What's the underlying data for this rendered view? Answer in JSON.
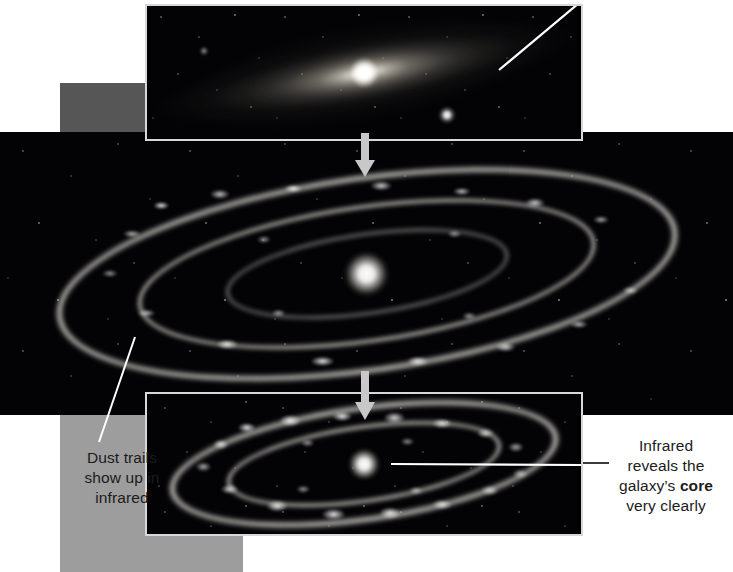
{
  "figure": {
    "background_color": "#ffffff"
  },
  "panels": [
    {
      "id": "visible-light",
      "name": "visible-light-panel",
      "description": "Visible light image of spiral galaxy with bright smooth core",
      "frame_color": "#d8d8d8",
      "sky_color": "#000000"
    },
    {
      "id": "infrared-wide",
      "name": "infrared-wide-panel",
      "description": "Wide infrared image of the galaxy showing dust rings",
      "frame_color": "#050507",
      "sky_color": "#050507"
    },
    {
      "id": "infrared-detail",
      "name": "infrared-detail-panel",
      "description": "Close infrared image revealing the galaxy core and dust rings",
      "frame_color": "#d8d8d8",
      "sky_color": "#000000"
    }
  ],
  "annotations": {
    "dust_trails": {
      "lines": [
        "Dust trails",
        "show up in",
        "infrared"
      ],
      "text": "Dust trails show up in infrared",
      "color": "#1b1b1b"
    },
    "infrared_core": {
      "line1": "Infrared",
      "line2": "reveals the",
      "line3_prefix": "galaxy’s ",
      "line3_bold": "core",
      "line4": "very clearly",
      "text": "Infrared reveals the galaxy’s core very clearly",
      "color": "#1b1b1b"
    }
  },
  "arrows": {
    "top_to_middle": "down-arrow",
    "middle_to_bottom": "down-arrow",
    "color": "#c8c8c8"
  },
  "leader_lines": {
    "top_right": "leader-line-to-visible-disk",
    "dust_trails": "leader-line-to-dust-lane",
    "core": "leader-line-to-core",
    "color": "#ffffff"
  },
  "blocks": {
    "gray_upper": "#565656",
    "gray_lower": "#9d9d9d"
  },
  "footer": {
    "cut_off_text": ""
  }
}
